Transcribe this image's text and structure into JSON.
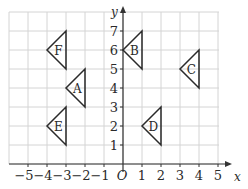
{
  "chart_data": {
    "type": "diagram",
    "title": "",
    "axes": {
      "x": {
        "label": "x",
        "min": -5,
        "max": 5,
        "ticks": [
          "−5",
          "−4",
          "−3",
          "−2",
          "−1",
          "1",
          "2",
          "3",
          "4",
          "5"
        ]
      },
      "y": {
        "label": "y",
        "min": 0,
        "max": 7,
        "ticks": [
          "1",
          "2",
          "3",
          "4",
          "5",
          "6",
          "7"
        ]
      },
      "origin_label": "O",
      "grid": true
    },
    "shapes": [
      {
        "label": "A",
        "vertices": [
          [
            -2,
            5
          ],
          [
            -2,
            3
          ],
          [
            -3,
            4
          ]
        ],
        "label_pos": [
          -2.4,
          4
        ]
      },
      {
        "label": "B",
        "vertices": [
          [
            1,
            7
          ],
          [
            1,
            5
          ],
          [
            0,
            6
          ]
        ],
        "label_pos": [
          0.6,
          6
        ]
      },
      {
        "label": "C",
        "vertices": [
          [
            4,
            6
          ],
          [
            4,
            4
          ],
          [
            3,
            5
          ]
        ],
        "label_pos": [
          3.6,
          5
        ]
      },
      {
        "label": "D",
        "vertices": [
          [
            2,
            3
          ],
          [
            2,
            1
          ],
          [
            1,
            2
          ]
        ],
        "label_pos": [
          1.6,
          2
        ]
      },
      {
        "label": "E",
        "vertices": [
          [
            -3,
            3
          ],
          [
            -3,
            1
          ],
          [
            -4,
            2
          ]
        ],
        "label_pos": [
          -3.4,
          2
        ]
      },
      {
        "label": "F",
        "vertices": [
          [
            -3,
            7
          ],
          [
            -3,
            5
          ],
          [
            -4,
            6
          ]
        ],
        "label_pos": [
          -3.4,
          6
        ]
      }
    ]
  },
  "colors": {
    "grid": "#d4d4d4",
    "axis": "#333333",
    "shape": "#2a2a2a"
  }
}
